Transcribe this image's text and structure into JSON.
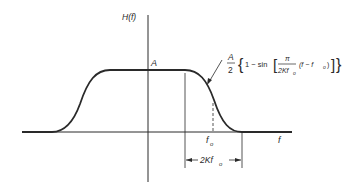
{
  "figure": {
    "y_axis_label": "H(f)",
    "x_axis_label": "f",
    "amplitude_label": "A",
    "f0_label": "f",
    "f0_subscript": "o",
    "span_label": "2Kf",
    "span_subscript": "o",
    "formula": {
      "coef_num": "A",
      "coef_den": "2",
      "open_brace": "{",
      "one_minus": "1 − sin",
      "open_bracket": "[",
      "frac_num": "π",
      "frac_den": "2Kf",
      "frac_den_sub": "o",
      "arg": "(f − f",
      "arg_sub": "o",
      "arg_close": ")",
      "close_bracket": "]",
      "close_brace": "}"
    },
    "colors": {
      "ink": "#2a2a2a",
      "background": "#ffffff"
    }
  }
}
